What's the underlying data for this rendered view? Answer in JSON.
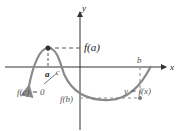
{
  "diagram": {
    "axes": {
      "x_label": "x",
      "y_label": "y"
    },
    "labels": {
      "f_a": "f(a)",
      "a": "a",
      "c": "c",
      "b": "b",
      "f_c_eq": "f(c) = 0",
      "f_b": "f(b)",
      "curve": "y = f(x)"
    },
    "colors": {
      "curve": "#8a8a8a",
      "axis": "#333333",
      "dash": "#555555",
      "point": "#333333"
    }
  }
}
